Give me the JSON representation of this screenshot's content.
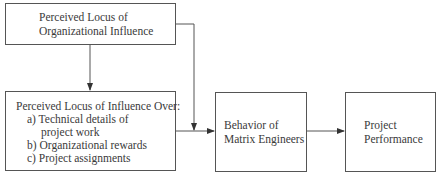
{
  "diagram": {
    "nodes": [
      {
        "id": "org_influence",
        "lines": [
          "Perceived Locus of",
          "Organizational Influence"
        ]
      },
      {
        "id": "influence_over",
        "title": "Perceived Locus of Influence Over:",
        "items": [
          "a) Technical details of",
          "project work",
          "b) Organizational rewards",
          "c) Project assignments"
        ]
      },
      {
        "id": "behavior",
        "lines": [
          "Behavior of",
          "Matrix Engineers"
        ]
      },
      {
        "id": "performance",
        "lines": [
          "Project",
          "Performance"
        ]
      }
    ],
    "edges": [
      {
        "from": "org_influence",
        "to": "influence_over"
      },
      {
        "from": "org_influence",
        "to": "behavior"
      },
      {
        "from": "influence_over",
        "to": "behavior"
      },
      {
        "from": "behavior",
        "to": "performance"
      }
    ]
  }
}
